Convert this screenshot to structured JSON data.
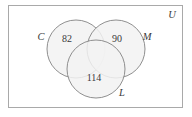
{
  "figure": {
    "type": "venn-diagram",
    "universe": {
      "label": "U",
      "border_color": "#a9a9a9",
      "fill_color": "#ffffff"
    },
    "style": {
      "circle_stroke": "#8f8f8f",
      "circle_fill": "#f2f2f2",
      "text_color": "#3a3a3a"
    },
    "sets": [
      {
        "name": "set-c",
        "label": "C",
        "label_x": 41,
        "label_y": 38,
        "cx": 76,
        "cy": 49,
        "r": 29
      },
      {
        "name": "set-m",
        "label": "M",
        "label_x": 147,
        "label_y": 38,
        "cx": 116,
        "cy": 49,
        "r": 29
      },
      {
        "name": "set-l",
        "label": "L",
        "label_x": 122,
        "label_y": 94,
        "cx": 96,
        "cy": 69,
        "r": 29
      }
    ],
    "regions": [
      {
        "name": "region-c-only",
        "value": "82",
        "x": 67,
        "y": 40
      },
      {
        "name": "region-m-only",
        "value": "90",
        "x": 117,
        "y": 40
      },
      {
        "name": "region-l-only",
        "value": "114",
        "x": 94,
        "y": 79
      }
    ]
  }
}
